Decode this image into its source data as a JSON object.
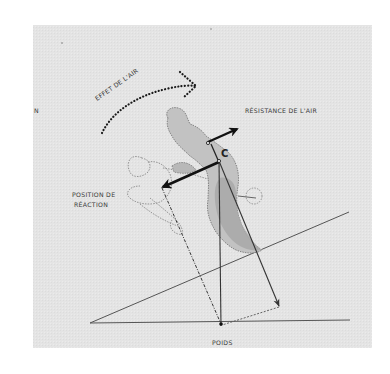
{
  "diagram": {
    "colors": {
      "panel": "#e4e4e4",
      "line": "#444444",
      "arrow": "#111111",
      "figure_fill": "#c4c4c4",
      "figure_shadow": "#a8a8a8",
      "figure_outline": "#7a7a7a",
      "dotted_arrow": "#1a1a1a"
    },
    "labels": {
      "air_effect": "EFFET DE L'AIR",
      "air_resistance": "RÉSISTANCE DE L'AIR",
      "reaction_position_line1": "POSITION DE",
      "reaction_position_line2": "RÉACTION",
      "weight": "POIDS",
      "center_point": "C",
      "left_edge_fragment": "N"
    }
  }
}
